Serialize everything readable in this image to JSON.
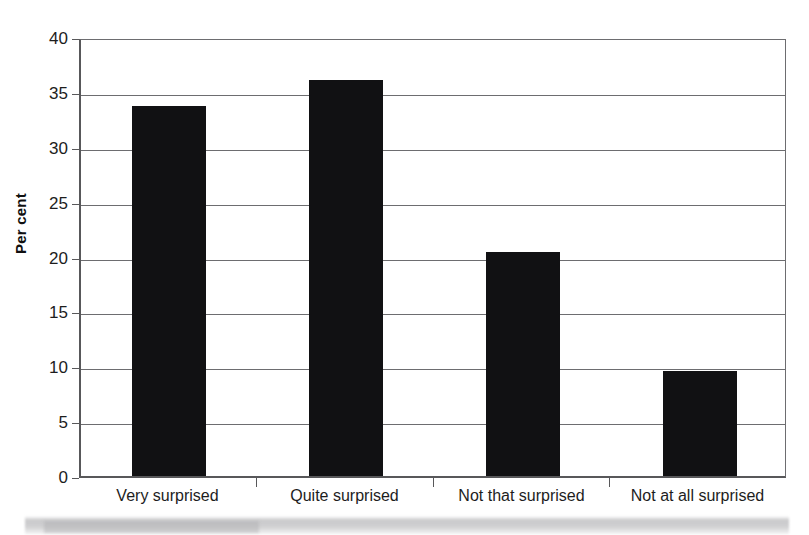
{
  "chart_data": {
    "type": "bar",
    "title": "",
    "subtitle": "",
    "xlabel": "",
    "ylabel": "Per cent",
    "categories": [
      "Very surprised",
      "Quite surprised",
      "Not that surprised",
      "Not at all surprised"
    ],
    "values": [
      33.7,
      36.1,
      20.4,
      9.6
    ],
    "ylim": [
      0,
      40
    ],
    "ytick_values": [
      0,
      5,
      10,
      15,
      20,
      25,
      30,
      35,
      40
    ],
    "ytick_labels": [
      "0",
      "5",
      "10",
      "15",
      "20",
      "25",
      "30",
      "35",
      "40"
    ],
    "grid": true,
    "grid_axis": "y",
    "legend": false,
    "legend_position": "none",
    "bar_color": "#111113",
    "axis_color": "#58585a",
    "grid_color": "#6d6d70",
    "background_color": "#ffffff",
    "annotations": []
  },
  "axis": {
    "y_title": "Per cent"
  },
  "artifact": {
    "name": "scan-smudge"
  }
}
